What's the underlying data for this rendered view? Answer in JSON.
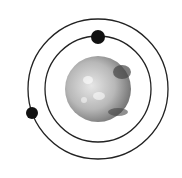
{
  "diagram": {
    "title": "Planet with two orbiting satellites",
    "background": "#ffffff",
    "planet": {
      "cx": 98,
      "cy": 89,
      "r": 33,
      "fill_light": "#d9d9d9",
      "fill_dark": "#6a6a6a"
    },
    "orbits": [
      {
        "name": "inner-orbit",
        "cx": 98,
        "cy": 89,
        "r": 53,
        "stroke": "#222222"
      },
      {
        "name": "outer-orbit",
        "cx": 98,
        "cy": 89,
        "r": 70,
        "stroke": "#222222"
      }
    ],
    "satellites": [
      {
        "name": "inner-satellite",
        "cx": 98,
        "cy": 37,
        "r": 7,
        "fill": "#111111"
      },
      {
        "name": "outer-satellite",
        "cx": 32,
        "cy": 113,
        "r": 6,
        "fill": "#111111"
      }
    ]
  }
}
